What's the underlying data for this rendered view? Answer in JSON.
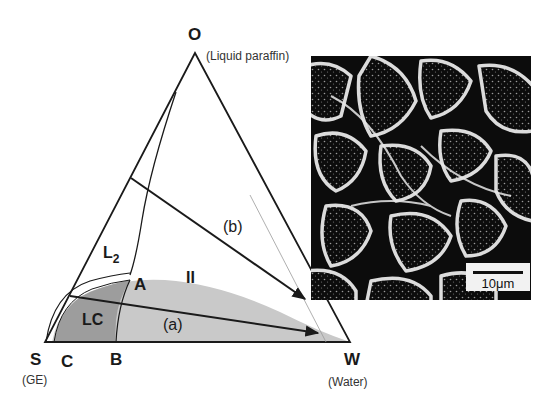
{
  "figure": {
    "type": "ternary phase diagram with SEM micrograph",
    "vertices": {
      "top": {
        "label": "O",
        "sublabel": "(Liquid paraffin)"
      },
      "left": {
        "label": "S",
        "sublabel": "(GE)"
      },
      "right": {
        "label": "W",
        "sublabel": "(Water)"
      }
    },
    "points": {
      "A": "A",
      "B": "B",
      "C": "C"
    },
    "regions": {
      "L2": {
        "label": "L",
        "subscript": "2"
      },
      "LC": {
        "label": "LC"
      },
      "II": {
        "label": "II"
      }
    },
    "paths": {
      "a": {
        "label": "(a)"
      },
      "b": {
        "label": "(b)"
      }
    },
    "colors": {
      "line": "#1a1a1a",
      "region_II": "#c8c8c8",
      "region_LC": "#9e9e9e",
      "background": "#ffffff"
    }
  },
  "micrograph": {
    "scale_bar": "10μm"
  }
}
